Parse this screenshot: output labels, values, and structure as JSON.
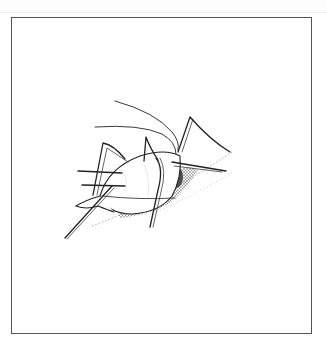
{
  "figure": {
    "description": "Black-and-white line illustration of an aphid feeding on a plant stem, enclosed in a rectangular border",
    "colors": {
      "background": "#ffffff",
      "frame": "#555555",
      "ink": "#222222",
      "stipple": "#444444",
      "leaf_dots": "#999999"
    },
    "icons": [
      "aphid-illustration",
      "plant-stem"
    ]
  }
}
